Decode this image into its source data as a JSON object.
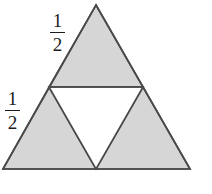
{
  "figure": {
    "name": "sierpinski-triangle-stage-1",
    "colors": {
      "background": "#ffffff",
      "shaded_fill": "#d6d6d6",
      "unshaded_fill": "#ffffff",
      "stroke": "#4a4a4a",
      "text": "#1c1c1c"
    },
    "geometry": {
      "apex": [
        96,
        5
      ],
      "bottom_left": [
        3,
        169
      ],
      "bottom_right": [
        190,
        169
      ],
      "mid_left": [
        49,
        87
      ],
      "mid_right": [
        143,
        87
      ],
      "mid_bottom": [
        96,
        169
      ]
    },
    "stroke_width": 1.6
  },
  "labels": [
    {
      "id": "label-top-left",
      "name": "fraction-label-upper-left-side",
      "numerator": "1",
      "denominator": "2",
      "text": "1/2",
      "edge": "upper-left side of large triangle"
    },
    {
      "id": "label-mid-left",
      "name": "fraction-label-lower-left-side",
      "numerator": "1",
      "denominator": "2",
      "text": "1/2",
      "edge": "lower-left side of large triangle"
    }
  ]
}
